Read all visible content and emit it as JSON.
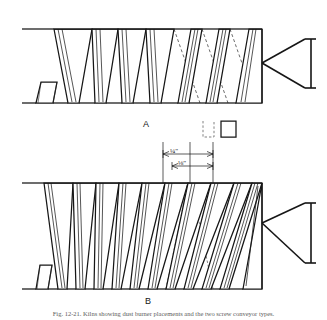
{
  "figure": {
    "caption": "Fig. 12-21. Kilns showing dust burner placements and the two screw conveyor types.",
    "panels": [
      {
        "id": "A",
        "label": "A",
        "description": "coarse-pitch screw conveyor flight with discharge cone",
        "flight_count": 6,
        "pitch_type": "coarse"
      },
      {
        "id": "B",
        "label": "B",
        "description": "fine-pitch screw conveyor flight with discharge cone",
        "flight_count": 11,
        "pitch_type": "fine"
      }
    ],
    "dimensions": [
      {
        "id": "pitch-outer",
        "label": "¼\"",
        "value": "1/4 inch"
      },
      {
        "id": "pitch-inner",
        "label": "⅛\"",
        "value": "1/8 inch"
      }
    ],
    "detail_boxes": [
      {
        "id": "detail-dashed",
        "style": "dashed"
      },
      {
        "id": "detail-solid",
        "style": "solid"
      }
    ],
    "colors": {
      "ink": "#161616",
      "paper": "#ffffff",
      "light_ink": "#4a4a4a"
    }
  }
}
